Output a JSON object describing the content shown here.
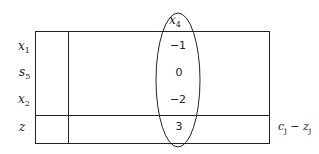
{
  "tableau": {
    "column_header": {
      "var": "x",
      "sub": "4"
    },
    "rows": [
      {
        "var": "x",
        "sub": "1",
        "value": "−1"
      },
      {
        "var": "s",
        "sub": "5",
        "value": "0"
      },
      {
        "var": "x",
        "sub": "2",
        "value": "−2"
      }
    ],
    "z_row": {
      "label": "z",
      "value": "3"
    },
    "right_label": {
      "c": "c",
      "c_sub": "j",
      "minus": " − ",
      "z": "z",
      "z_sub": "j"
    }
  }
}
